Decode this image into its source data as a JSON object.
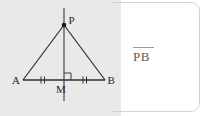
{
  "figure": {
    "vertices": {
      "apex_label": "P",
      "left_base_label": "A",
      "right_base_label": "B",
      "midpoint_label": "M"
    },
    "markings": {
      "right_angle_at": "M",
      "congruent_ticks": "double",
      "congruent_segments": [
        "AM",
        "MB"
      ]
    },
    "line_color": "#2e2e2e",
    "background_color": "#e9e9e9"
  },
  "answer": {
    "expression": "PB",
    "overbar": true,
    "panel_background": "#ffffff",
    "border_color": "#d3d3d3"
  }
}
